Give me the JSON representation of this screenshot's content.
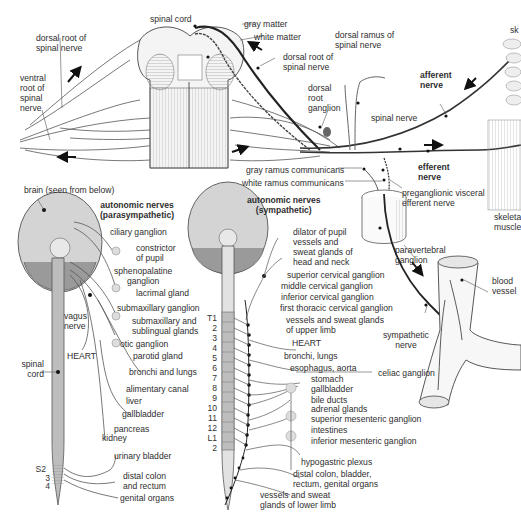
{
  "diagram": {
    "top_panel": {
      "labels": {
        "spinal_cord": "spinal cord",
        "gray_matter": "gray matter",
        "white_matter": "white matter",
        "dorsal_root_left": "dorsal root of\nspinal nerve",
        "ventral_root": "ventral\nroot of\nspinal\nnerve",
        "dorsal_root_right": "dorsal root of\nspinal nerve",
        "dorsal_ramus": "dorsal ramus of\nspinal nerve",
        "dorsal_root_ganglion": "dorsal\nroot\nganglion",
        "spinal_nerve": "spinal nerve",
        "afferent_nerve": "afferent\nnerve",
        "efferent_nerve": "efferent\nnerve",
        "gray_ramus": "gray ramus communicans",
        "white_ramus": "white ramus communicans",
        "preganglionic": "preganglionic visceral\nefferent nerve",
        "skin": "sk",
        "skeletal_muscle": "skeleta\nmuscle",
        "paravertebral_ganglion": "paravertebral\nganglion",
        "blood_vessel": "blood\nvessel",
        "sympathetic_nerve": "sympathetic\nnerve"
      }
    },
    "parasympathetic_panel": {
      "title": "autonomic nerves\n(parasympathetic)",
      "brain_label": "brain (seen from below)",
      "vagus_label": "vagus\nnerve",
      "heart_label": "HEART",
      "spinal_cord_label": "spinal\ncord",
      "sacral_levels": [
        "S2",
        "3",
        "4"
      ],
      "targets": [
        "ciliary ganglion",
        "constrictor\nof pupil",
        "sphenopalatine\nganglion",
        "lacrimal gland",
        "submaxillary ganglion",
        "submaxillary and\nsublingual glands",
        "otic ganglion",
        "parotid gland",
        "bronchi and lungs",
        "alimentary canal",
        "liver",
        "gallbladder",
        "pancreas",
        "kidney",
        "urinary bladder",
        "distal colon\nand rectum",
        "genital organs"
      ]
    },
    "sympathetic_panel": {
      "title": "autonomic nerves\n(sympathetic)",
      "levels": [
        "T1",
        "2",
        "3",
        "4",
        "5",
        "6",
        "7",
        "8",
        "9",
        "10",
        "11",
        "12",
        "L1",
        "2"
      ],
      "targets": [
        "dilator of pupil",
        "vessels and\nsweat glands of\nhead and neck",
        "superior cervical ganglion",
        "middle cervical ganglion",
        "inferior cervical ganglion",
        "first thoracic cervical ganglion",
        "vessels and sweat glands\nof upper limb",
        "HEART",
        "bronchi, lungs",
        "esophagus, aorta",
        "celiac ganglion",
        "stomach",
        "gallbladder",
        "bile ducts",
        "adrenal glands",
        "superior mesenteric ganglion",
        "intestines",
        "inferior mesenteric ganglion",
        "hypogastric plexus",
        "distal colon, bladder,\nrectum, genital organs",
        "vessels and sweat\nglands of lower limb"
      ]
    },
    "colors": {
      "ink": "#2a2a2a",
      "brain_fill": "#cfcfcf",
      "cord_fill": "#bdbdbd",
      "cord_light": "#e2e2e2",
      "nerve": "#333333",
      "ganglion_fill": "#d8d8d8"
    }
  }
}
